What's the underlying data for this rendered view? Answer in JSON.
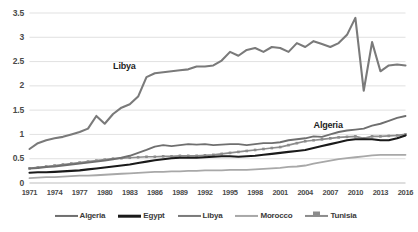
{
  "chart_data": {
    "type": "line",
    "title": "",
    "subtitle": "",
    "xlabel": "",
    "ylabel": "",
    "grid": true,
    "legend_position": "bottom",
    "xlim": [
      1971,
      2016
    ],
    "ylim": [
      0,
      3.5
    ],
    "ytick_labels": [
      "0",
      "0.5",
      "1",
      "1.5",
      "2",
      "2.5",
      "3",
      "3.5"
    ],
    "ytick_values": [
      0,
      0.5,
      1,
      1.5,
      2,
      2.5,
      3,
      3.5
    ],
    "xtick_labels": [
      "1971",
      "1974",
      "1977",
      "1980",
      "1983",
      "1986",
      "1989",
      "1992",
      "1995",
      "1998",
      "2001",
      "2004",
      "2007",
      "2010",
      "2013",
      "2016"
    ],
    "xtick_values": [
      1971,
      1974,
      1977,
      1980,
      1983,
      1986,
      1989,
      1992,
      1995,
      1998,
      2001,
      2004,
      2007,
      2010,
      2013,
      2016
    ],
    "x": [
      1971,
      1972,
      1973,
      1974,
      1975,
      1976,
      1977,
      1978,
      1979,
      1980,
      1981,
      1982,
      1983,
      1984,
      1985,
      1986,
      1987,
      1988,
      1989,
      1990,
      1991,
      1992,
      1993,
      1994,
      1995,
      1996,
      1997,
      1998,
      1999,
      2000,
      2001,
      2002,
      2003,
      2004,
      2005,
      2006,
      2007,
      2008,
      2009,
      2010,
      2011,
      2012,
      2013,
      2014,
      2015,
      2016
    ],
    "annotations": [
      {
        "text": "Libya",
        "x": 1981,
        "y": 2.42
      },
      {
        "text": "Algeria",
        "x": 2005,
        "y": 1.2
      }
    ],
    "series": [
      {
        "name": "Algeria",
        "color": "#6f6f6f",
        "marker": "none",
        "width": 1.9,
        "values": [
          0.3,
          0.31,
          0.33,
          0.34,
          0.36,
          0.38,
          0.4,
          0.42,
          0.44,
          0.46,
          0.49,
          0.52,
          0.56,
          0.62,
          0.68,
          0.75,
          0.78,
          0.76,
          0.78,
          0.8,
          0.79,
          0.8,
          0.78,
          0.79,
          0.8,
          0.8,
          0.78,
          0.8,
          0.82,
          0.82,
          0.84,
          0.88,
          0.9,
          0.92,
          0.96,
          0.95,
          1.0,
          1.05,
          1.08,
          1.1,
          1.12,
          1.18,
          1.22,
          1.28,
          1.34,
          1.38
        ]
      },
      {
        "name": "Egypt",
        "color": "#1a1a1a",
        "marker": "none",
        "width": 2.1,
        "values": [
          0.21,
          0.22,
          0.22,
          0.23,
          0.24,
          0.25,
          0.26,
          0.28,
          0.3,
          0.32,
          0.34,
          0.36,
          0.38,
          0.41,
          0.44,
          0.47,
          0.49,
          0.51,
          0.52,
          0.52,
          0.52,
          0.53,
          0.54,
          0.55,
          0.55,
          0.54,
          0.55,
          0.56,
          0.58,
          0.6,
          0.62,
          0.64,
          0.66,
          0.68,
          0.72,
          0.76,
          0.8,
          0.84,
          0.88,
          0.9,
          0.9,
          0.9,
          0.88,
          0.88,
          0.92,
          0.98
        ]
      },
      {
        "name": "Libya",
        "color": "#7a7a7a",
        "marker": "none",
        "width": 2.1,
        "values": [
          0.7,
          0.82,
          0.88,
          0.92,
          0.95,
          1.0,
          1.05,
          1.12,
          1.38,
          1.22,
          1.42,
          1.55,
          1.62,
          1.78,
          2.18,
          2.26,
          2.28,
          2.3,
          2.32,
          2.34,
          2.4,
          2.4,
          2.42,
          2.52,
          2.7,
          2.62,
          2.74,
          2.78,
          2.7,
          2.8,
          2.78,
          2.7,
          2.88,
          2.8,
          2.92,
          2.86,
          2.8,
          2.88,
          3.05,
          3.4,
          1.9,
          2.9,
          2.3,
          2.42,
          2.44,
          2.42
        ]
      },
      {
        "name": "Morocco",
        "color": "#a8a8a8",
        "marker": "none",
        "width": 1.8,
        "values": [
          0.1,
          0.11,
          0.12,
          0.12,
          0.13,
          0.14,
          0.15,
          0.15,
          0.16,
          0.17,
          0.18,
          0.19,
          0.2,
          0.21,
          0.22,
          0.23,
          0.23,
          0.24,
          0.24,
          0.25,
          0.25,
          0.26,
          0.26,
          0.26,
          0.27,
          0.27,
          0.27,
          0.28,
          0.29,
          0.3,
          0.31,
          0.33,
          0.34,
          0.36,
          0.4,
          0.43,
          0.46,
          0.49,
          0.51,
          0.53,
          0.55,
          0.57,
          0.58,
          0.58,
          0.58,
          0.58
        ]
      },
      {
        "name": "Tunisia",
        "color": "#8c8c8c",
        "marker": "square",
        "width": 1.7,
        "values": [
          0.3,
          0.32,
          0.34,
          0.36,
          0.38,
          0.4,
          0.42,
          0.44,
          0.46,
          0.48,
          0.5,
          0.51,
          0.52,
          0.53,
          0.54,
          0.54,
          0.55,
          0.55,
          0.56,
          0.56,
          0.56,
          0.57,
          0.58,
          0.6,
          0.62,
          0.64,
          0.66,
          0.68,
          0.7,
          0.72,
          0.74,
          0.78,
          0.82,
          0.86,
          0.88,
          0.9,
          0.92,
          0.94,
          0.95,
          0.96,
          0.92,
          0.96,
          0.96,
          0.97,
          0.98,
          1.0
        ]
      }
    ]
  },
  "legend": {
    "items": [
      {
        "label": "Algeria",
        "color": "#6f6f6f",
        "marker": "none"
      },
      {
        "label": "Egypt",
        "color": "#1a1a1a",
        "marker": "none"
      },
      {
        "label": "Libya",
        "color": "#7a7a7a",
        "marker": "none"
      },
      {
        "label": "Morocco",
        "color": "#a8a8a8",
        "marker": "none"
      },
      {
        "label": "Tunisia",
        "color": "#8c8c8c",
        "marker": "square"
      }
    ]
  },
  "style": {
    "background": "#ffffff",
    "grid_color": "#d9d9d9",
    "tick_text_color": "#4a4a4a",
    "annotation_color": "#1d1d1d"
  }
}
